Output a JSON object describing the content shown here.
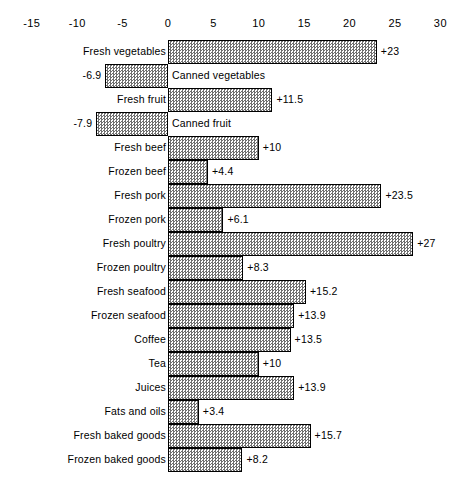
{
  "chart_data": {
    "type": "bar",
    "orientation": "horizontal",
    "title": "",
    "subtitle": "",
    "xlabel": "",
    "ylabel": "",
    "xlim": [
      -15,
      30
    ],
    "grid": false,
    "legend": null,
    "zero_line": 0,
    "xticks": [
      -15,
      -10,
      -5,
      0,
      5,
      10,
      15,
      20,
      25,
      30
    ],
    "xticklabels": [
      "-15",
      "-10",
      "-5",
      "0",
      "5",
      "10",
      "15",
      "20",
      "25",
      "30"
    ],
    "categories": [
      "Fresh vegetables",
      "Canned vegetables",
      "Fresh fruit",
      "Canned fruit",
      "Fresh beef",
      "Frozen beef",
      "Fresh pork",
      "Frozen pork",
      "Fresh poultry",
      "Frozen poultry",
      "Fresh seafood",
      "Frozen seafood",
      "Coffee",
      "Tea",
      "Juices",
      "Fats and oils",
      "Fresh baked goods",
      "Frozen baked goods"
    ],
    "values": [
      23,
      -6.9,
      11.5,
      -7.9,
      10,
      4.4,
      23.5,
      6.1,
      27,
      8.3,
      15.2,
      13.9,
      13.5,
      10,
      13.9,
      3.4,
      15.7,
      8.2
    ],
    "data_labels": [
      "+23",
      "-6.9",
      "+11.5",
      "-7.9",
      "+10",
      "+4.4",
      "+23.5",
      "+6.1",
      "+27",
      "+8.3",
      "+15.2",
      "+13.9",
      "+13.5",
      "+10",
      "+13.9",
      "+3.4",
      "+15.7",
      "+8.2"
    ],
    "bars": [
      {
        "category": "Fresh vegetables",
        "value": 23,
        "label": "+23"
      },
      {
        "category": "Canned vegetables",
        "value": -6.9,
        "label": "-6.9"
      },
      {
        "category": "Fresh fruit",
        "value": 11.5,
        "label": "+11.5"
      },
      {
        "category": "Canned fruit",
        "value": -7.9,
        "label": "-7.9"
      },
      {
        "category": "Fresh beef",
        "value": 10,
        "label": "+10"
      },
      {
        "category": "Frozen beef",
        "value": 4.4,
        "label": "+4.4"
      },
      {
        "category": "Fresh pork",
        "value": 23.5,
        "label": "+23.5"
      },
      {
        "category": "Frozen pork",
        "value": 6.1,
        "label": "+6.1"
      },
      {
        "category": "Fresh poultry",
        "value": 27,
        "label": "+27"
      },
      {
        "category": "Frozen poultry",
        "value": 8.3,
        "label": "+8.3"
      },
      {
        "category": "Fresh seafood",
        "value": 15.2,
        "label": "+15.2"
      },
      {
        "category": "Frozen seafood",
        "value": 13.9,
        "label": "+13.9"
      },
      {
        "category": "Coffee",
        "value": 13.5,
        "label": "+13.5"
      },
      {
        "category": "Tea",
        "value": 10,
        "label": "+10"
      },
      {
        "category": "Juices",
        "value": 13.9,
        "label": "+13.9"
      },
      {
        "category": "Fats and oils",
        "value": 3.4,
        "label": "+3.4"
      },
      {
        "category": "Fresh baked goods",
        "value": 15.7,
        "label": "+15.7"
      },
      {
        "category": "Frozen baked goods",
        "value": 8.2,
        "label": "+8.2"
      }
    ],
    "colors": {
      "bar_fill": "#6f6f6f",
      "bar_border": "#000000",
      "background": "#ffffff",
      "text": "#000000"
    }
  }
}
